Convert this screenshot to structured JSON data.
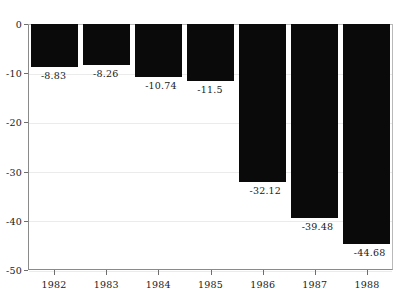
{
  "chart_data": {
    "type": "bar",
    "title": "",
    "subtitle": "",
    "xlabel": "",
    "ylabel": "",
    "categories": [
      "1982",
      "1983",
      "1984",
      "1985",
      "1986",
      "1987",
      "1988"
    ],
    "values": [
      -8.83,
      -8.26,
      -10.74,
      -11.5,
      -32.12,
      -39.48,
      -44.68
    ],
    "data_labels": [
      "-8.83",
      "-8.26",
      "-10.74",
      "-11.5",
      "-32.12",
      "-39.48",
      "-44.68"
    ],
    "ylim": [
      -50,
      0
    ],
    "y_ticks": [
      0,
      -10,
      -20,
      -30,
      -40,
      -50
    ],
    "y_tick_labels": [
      "0",
      "-10",
      "-20",
      "-30",
      "-40",
      "-50"
    ],
    "grid": true,
    "legend": null,
    "legend_position": "none",
    "bar_color": "#0a0a0a",
    "grid_color": "#ebebeb",
    "axis_color": "#8a8a8a",
    "background_color": "#ffffff",
    "text_color": "#1a1a1a"
  }
}
